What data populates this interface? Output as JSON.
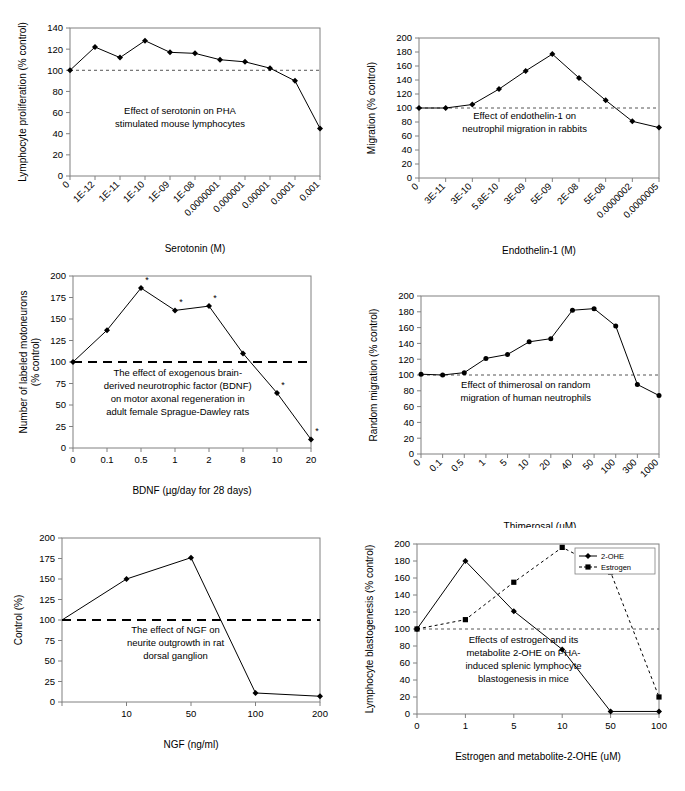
{
  "figure": {
    "panel_count": 6,
    "reference_line_value": 100,
    "colors": {
      "axis": "#808080",
      "line": "#000000",
      "marker": "#000000",
      "refline": "#555555",
      "legend_border": "#808080"
    }
  },
  "charts": [
    {
      "id": "panel-a-serotonin",
      "type": "line",
      "title": "",
      "annotation": [
        "Effect of serotonin on PHA",
        "stimulated mouse lymphocytes"
      ],
      "xlabel": "Serotonin (M)",
      "ylabel": "Lymphocyte proliferation (% control)",
      "categories": [
        "0",
        "1E-12",
        "1E-11",
        "1E-10",
        "1E-09",
        "1E-08",
        "0.0000001",
        "0.000001",
        "0.00001",
        "0.0001",
        "0.001"
      ],
      "values": [
        100,
        122,
        112,
        128,
        117,
        116,
        110,
        108,
        102,
        90,
        45
      ],
      "ylim": [
        0,
        140
      ],
      "yticks": [
        0,
        20,
        40,
        60,
        80,
        100,
        120,
        140
      ],
      "reference_line": 100,
      "reference_style": "dotted",
      "marker": "diamond",
      "grid": false,
      "xtick_rotation": -45
    },
    {
      "id": "panel-b-endothelin",
      "type": "line",
      "title": "",
      "annotation": [
        "Effect of endothelin-1 on",
        "neutrophil migration in rabbits"
      ],
      "xlabel": "Endothelin-1 (M)",
      "ylabel": "Migration (% control)",
      "categories": [
        "0",
        "3E-11",
        "3E-10",
        "5.8E-10",
        "3E-09",
        "5E-09",
        "2E-08",
        "5E-08",
        "0.0000002",
        "0.0000005"
      ],
      "values": [
        100,
        100,
        105,
        127,
        153,
        177,
        143,
        111,
        81,
        72
      ],
      "ylim": [
        0,
        200
      ],
      "yticks": [
        0,
        20,
        40,
        60,
        80,
        100,
        120,
        140,
        160,
        180,
        200
      ],
      "reference_line": 100,
      "reference_style": "dotted",
      "marker": "diamond",
      "grid": false,
      "xtick_rotation": -45
    },
    {
      "id": "panel-c-bdnf",
      "type": "line",
      "title": "",
      "annotation": [
        "The effect of exogenous brain-",
        "derived neurotrophic factor (BDNF)",
        "on motor axonal regeneration in",
        "adult female Sprague-Dawley rats"
      ],
      "xlabel": "BDNF (µg/day for 28 days)",
      "ylabel": [
        "Number of labeled motoneurons",
        "(% control)"
      ],
      "categories": [
        "0",
        "0.1",
        "0.5",
        "1",
        "2",
        "8",
        "10",
        "20"
      ],
      "values": [
        100,
        137,
        186,
        160,
        165,
        110,
        64,
        10
      ],
      "significance": [
        false,
        false,
        true,
        true,
        true,
        false,
        true,
        true
      ],
      "significance_marker": "*",
      "ylim": [
        0,
        200
      ],
      "yticks": [
        0,
        25,
        50,
        75,
        100,
        125,
        150,
        175,
        200
      ],
      "reference_line": 100,
      "reference_style": "dashed-bold",
      "marker": "diamond",
      "grid": false,
      "xtick_rotation": 0
    },
    {
      "id": "panel-d-thimerosal",
      "type": "line",
      "title": "",
      "annotation": [
        "Effect of thimerosal on random",
        "migration of human neutrophils"
      ],
      "xlabel": "Thimerosal (uM)",
      "ylabel": "Random migration (% control)",
      "categories": [
        "0",
        "0.1",
        "0.5",
        "1",
        "5",
        "10",
        "20",
        "40",
        "50",
        "100",
        "300",
        "1000"
      ],
      "values": [
        101,
        100,
        103,
        121,
        126,
        142,
        146,
        182,
        184,
        162,
        88,
        74
      ],
      "ylim": [
        0,
        200
      ],
      "yticks": [
        0,
        20,
        40,
        60,
        80,
        100,
        120,
        140,
        160,
        180,
        200
      ],
      "reference_line": 100,
      "reference_style": "dotted",
      "marker": "circle",
      "grid": false,
      "xtick_rotation": -45
    },
    {
      "id": "panel-e-ngf",
      "type": "line",
      "title": "",
      "annotation": [
        "The effect of NGF on",
        "neurite outgrowth in rat",
        "dorsal ganglion"
      ],
      "xlabel": "NGF (ng/ml)",
      "ylabel": "Control (%)",
      "categories": [
        "",
        "10",
        "50",
        "100",
        "200"
      ],
      "values": [
        100,
        150,
        176,
        11,
        7
      ],
      "first_point_hidden": true,
      "ylim": [
        0,
        200
      ],
      "yticks": [
        0,
        25,
        50,
        75,
        100,
        125,
        150,
        175,
        200
      ],
      "reference_line": 100,
      "reference_style": "dashed-bold",
      "marker": "diamond",
      "grid": false,
      "xtick_rotation": 0
    },
    {
      "id": "panel-f-estrogen",
      "type": "line",
      "title": "",
      "annotation": [
        "Effects of estrogen and its",
        "metabolite 2-OHE on PHA-",
        "induced splenic lymphocyte",
        "blastogenesis in mice"
      ],
      "xlabel": "Estrogen and metabolite-2-OHE (uM)",
      "ylabel": "Lymphocyte blastogenesis (% control)",
      "categories": [
        "0",
        "1",
        "5",
        "10",
        "50",
        "100"
      ],
      "series": [
        {
          "name": "2-OHE",
          "values": [
            100,
            180,
            121,
            76,
            3,
            3
          ],
          "marker": "diamond",
          "style": "solid"
        },
        {
          "name": "Estrogen",
          "values": [
            100,
            111,
            155,
            196,
            167,
            20
          ],
          "marker": "square",
          "style": "dashed"
        }
      ],
      "ylim": [
        0,
        200
      ],
      "yticks": [
        0,
        20,
        40,
        60,
        80,
        100,
        120,
        140,
        160,
        180,
        200
      ],
      "reference_line": 100,
      "reference_style": "dotted",
      "legend_position": "top-right",
      "grid": false,
      "xtick_rotation": 0
    }
  ]
}
